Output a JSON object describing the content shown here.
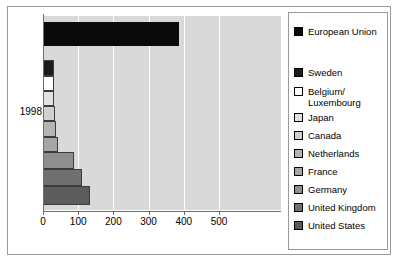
{
  "chart": {
    "type": "bar",
    "orientation": "horizontal",
    "category_label": "1998",
    "axis": {
      "ticks": [
        "0",
        "100",
        "200",
        "300",
        "400",
        "500"
      ],
      "xmin": 0,
      "xmax": 500
    }
  },
  "legend": {
    "items": [
      {
        "label": "European Union",
        "color": "#0a0a0a"
      },
      {
        "label": "Sweden",
        "color": "#1c1c1c"
      },
      {
        "label": "Belgium/\nLuxembourg",
        "color": "#ffffff"
      },
      {
        "label": "Japan",
        "color": "#e2e2e2"
      },
      {
        "label": "Canada",
        "color": "#d0d0d0"
      },
      {
        "label": "Netherlands",
        "color": "#b4b4b4"
      },
      {
        "label": "France",
        "color": "#a6a6a6"
      },
      {
        "label": "Germany",
        "color": "#8f8f8f"
      },
      {
        "label": "United Kingdom",
        "color": "#707070"
      },
      {
        "label": "United States",
        "color": "#5c5c5c"
      }
    ]
  },
  "chart_data": {
    "type": "bar",
    "title": "",
    "xlabel": "",
    "ylabel": "",
    "orientation": "horizontal",
    "categories": [
      "1998"
    ],
    "xlim": [
      0,
      500
    ],
    "xticks": [
      0,
      100,
      200,
      300,
      400,
      500
    ],
    "grid": true,
    "legend_position": "right",
    "series": [
      {
        "name": "European Union",
        "values": [
          385
        ],
        "color": "#0a0a0a"
      },
      {
        "name": "Sweden",
        "values": [
          30
        ],
        "color": "#1c1c1c"
      },
      {
        "name": "Belgium/Luxembourg",
        "values": [
          31
        ],
        "color": "#ffffff"
      },
      {
        "name": "Japan",
        "values": [
          32
        ],
        "color": "#e2e2e2"
      },
      {
        "name": "Canada",
        "values": [
          33
        ],
        "color": "#d0d0d0"
      },
      {
        "name": "Netherlands",
        "values": [
          38
        ],
        "color": "#b4b4b4"
      },
      {
        "name": "France",
        "values": [
          42
        ],
        "color": "#a6a6a6"
      },
      {
        "name": "Germany",
        "values": [
          88
        ],
        "color": "#8f8f8f"
      },
      {
        "name": "United Kingdom",
        "values": [
          112
        ],
        "color": "#707070"
      },
      {
        "name": "United States",
        "values": [
          133
        ],
        "color": "#5c5c5c"
      }
    ]
  }
}
